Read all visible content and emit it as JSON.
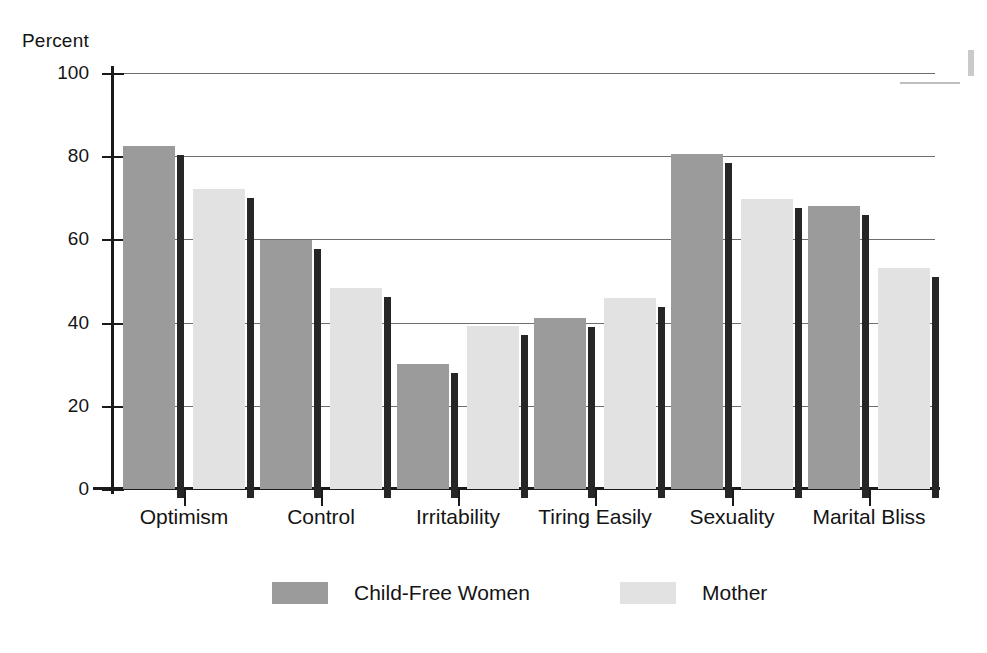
{
  "chart_data": {
    "type": "bar",
    "title": "",
    "xlabel": "",
    "ylabel": "Percent",
    "ylim": [
      0,
      100
    ],
    "yticks": [
      0,
      20,
      40,
      60,
      80,
      100
    ],
    "ytick_labels": [
      "0",
      "20",
      "40",
      "60",
      "80",
      "100"
    ],
    "grid": "horizontal",
    "legend_position": "bottom",
    "categories": [
      "Optimism",
      "Control",
      "Irritability",
      "Tiring Easily",
      "Sexuality",
      "Marital Bliss"
    ],
    "series": [
      {
        "name": "Child-Free Women",
        "color": "#9b9b9b",
        "values": [
          82.5,
          59.8,
          30.0,
          41.2,
          80.5,
          68.0
        ]
      },
      {
        "name": "Mother",
        "color": "#e2e2e2",
        "values": [
          72.2,
          48.3,
          39.3,
          45.8,
          69.8,
          53.2
        ]
      }
    ]
  },
  "legend": {
    "items": [
      {
        "label": "Child-Free Women",
        "color": "#9b9b9b"
      },
      {
        "label": "Mother",
        "color": "#e2e2e2"
      }
    ]
  },
  "colors": {
    "axis": "#1a1a1a",
    "gridline": "#6e6e6e",
    "bar_shadow": "#262626",
    "background": "#ffffff",
    "series_dark": "#9b9b9b",
    "series_light": "#e2e2e2"
  }
}
